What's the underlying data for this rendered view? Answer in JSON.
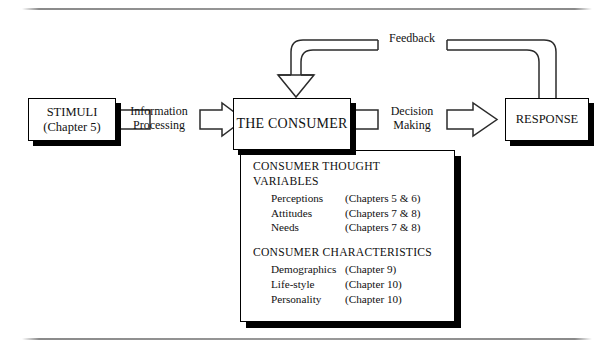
{
  "diagram": {
    "nodes": {
      "stimuli": {
        "line1": "STIMULI",
        "line2": "(Chapter 5)"
      },
      "consumer": {
        "label": "THE CONSUMER"
      },
      "response": {
        "label": "RESPONSE"
      }
    },
    "connectors": {
      "information_processing": {
        "line1": "Information",
        "line2": "Processing"
      },
      "decision_making": {
        "line1": "Decision",
        "line2": "Making"
      },
      "feedback": {
        "label": "Feedback"
      }
    },
    "panel": {
      "section1": {
        "line1": "CONSUMER THOUGHT",
        "line2": "VARIABLES",
        "items": [
          {
            "name": "Perceptions",
            "chapters": "(Chapters 5 & 6)"
          },
          {
            "name": "Attitudes",
            "chapters": "(Chapters 7 & 8)"
          },
          {
            "name": "Needs",
            "chapters": "(Chapters 7 & 8)"
          }
        ]
      },
      "section2": {
        "line1": "CONSUMER CHARACTERISTICS",
        "items": [
          {
            "name": "Demographics",
            "chapters": "(Chapter 9)"
          },
          {
            "name": "Life-style",
            "chapters": "(Chapter 10)"
          },
          {
            "name": "Personality",
            "chapters": "(Chapter 10)"
          }
        ]
      }
    },
    "colors": {
      "ink": "#2b2b2b",
      "shadow": "#000000",
      "rule": "#8a8a8a",
      "paper": "#ffffff"
    }
  }
}
